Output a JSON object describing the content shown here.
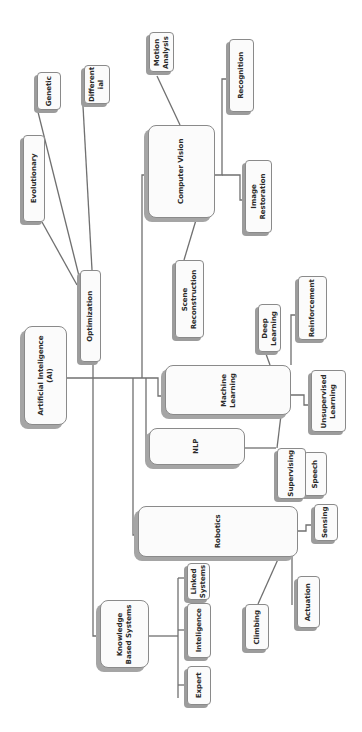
{
  "diagram": {
    "orientation": "rotated-90-ccw",
    "colors": {
      "box_fill": "#fbfbfb",
      "border": "#8a8a8a",
      "shadow": "#9c9c9c",
      "line": "#707070",
      "text": "#2a2a2a"
    },
    "nodes": {
      "ai": {
        "line1": "Artificial Inteligence",
        "line2": "(AI)"
      },
      "optimization": {
        "line1": "Optimization"
      },
      "evolutionary": {
        "line1": "Evolutionary"
      },
      "genetic": {
        "line1": "Genetic"
      },
      "differential": {
        "line1": "Different",
        "line2": "ial"
      },
      "computer_vision": {
        "line1": "Computer Vision"
      },
      "motion_analysis": {
        "line1": "Motion",
        "line2": "Analysis"
      },
      "recognition": {
        "line1": "Recognition"
      },
      "image_restoration": {
        "line1": "Image",
        "line2": "Restoration"
      },
      "scene_reconstruction": {
        "line1": "Scene",
        "line2": "Reconstruction"
      },
      "machine_learning": {
        "line1": "Machine",
        "line2": "Learning"
      },
      "deep_learning": {
        "line1": "Deep",
        "line2": "Learning"
      },
      "reinforcement": {
        "line1": "Reinforcement"
      },
      "unsupervised_learning": {
        "line1": "Unsupervised",
        "line2": "Learning"
      },
      "supervising": {
        "line1": "Supervising"
      },
      "nlp": {
        "line1": "NLP"
      },
      "speech": {
        "line1": "Speech"
      },
      "robotics": {
        "line1": "Robotics"
      },
      "sensing": {
        "line1": "Sensing"
      },
      "actuation": {
        "line1": "Actuation"
      },
      "climbing": {
        "line1": "Climbing"
      },
      "knowledge_based_systems": {
        "line1": "Knowledge",
        "line2": "Based Systems"
      },
      "linked_systems": {
        "line1": "Linked",
        "line2": "Systems"
      },
      "inteligence": {
        "line1": "Inteligence"
      },
      "expert": {
        "line1": "Expert"
      }
    },
    "edges": [
      [
        "ai",
        "optimization"
      ],
      [
        "ai",
        "computer_vision"
      ],
      [
        "ai",
        "machine_learning"
      ],
      [
        "ai",
        "nlp"
      ],
      [
        "ai",
        "robotics"
      ],
      [
        "ai",
        "knowledge_based_systems"
      ],
      [
        "optimization",
        "evolutionary"
      ],
      [
        "optimization",
        "genetic"
      ],
      [
        "optimization",
        "differential"
      ],
      [
        "computer_vision",
        "motion_analysis"
      ],
      [
        "computer_vision",
        "recognition"
      ],
      [
        "computer_vision",
        "image_restoration"
      ],
      [
        "computer_vision",
        "scene_reconstruction"
      ],
      [
        "machine_learning",
        "deep_learning"
      ],
      [
        "machine_learning",
        "reinforcement"
      ],
      [
        "machine_learning",
        "unsupervised_learning"
      ],
      [
        "machine_learning",
        "supervising"
      ],
      [
        "nlp",
        "speech"
      ],
      [
        "robotics",
        "sensing"
      ],
      [
        "robotics",
        "actuation"
      ],
      [
        "robotics",
        "climbing"
      ],
      [
        "knowledge_based_systems",
        "linked_systems"
      ],
      [
        "knowledge_based_systems",
        "inteligence"
      ],
      [
        "knowledge_based_systems",
        "expert"
      ]
    ]
  }
}
